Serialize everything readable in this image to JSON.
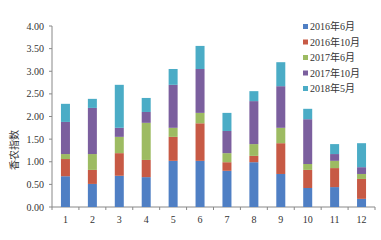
{
  "chart_data": {
    "type": "bar",
    "stacked": true,
    "title": "",
    "xlabel": "",
    "ylabel": "香农指数",
    "ylim": [
      0,
      4
    ],
    "yticks": [
      "0.00",
      "0.50",
      "1.00",
      "1.50",
      "2.00",
      "2.50",
      "3.00",
      "3.50",
      "4.00"
    ],
    "grid": false,
    "legend_position": "upper right",
    "categories": [
      "1",
      "2",
      "3",
      "4",
      "5",
      "6",
      "7",
      "8",
      "9",
      "10",
      "11",
      "12"
    ],
    "series": [
      {
        "name": "2016年6月",
        "color": "#4f7fc4",
        "values": [
          0.68,
          0.51,
          0.69,
          0.66,
          1.02,
          1.02,
          0.8,
          0.99,
          0.73,
          0.42,
          0.44,
          0.18
        ]
      },
      {
        "name": "2016年10月",
        "color": "#c75a45",
        "values": [
          0.38,
          0.31,
          0.5,
          0.38,
          0.53,
          0.83,
          0.19,
          0.14,
          0.68,
          0.4,
          0.42,
          0.44
        ]
      },
      {
        "name": "2017年6月",
        "color": "#9dbb62",
        "values": [
          0.11,
          0.35,
          0.36,
          0.82,
          0.2,
          0.23,
          0.2,
          0.26,
          0.34,
          0.13,
          0.16,
          0.11
        ]
      },
      {
        "name": "2017年10月",
        "color": "#7b5f9e",
        "values": [
          0.71,
          1.02,
          0.2,
          0.24,
          0.95,
          0.97,
          0.49,
          0.95,
          0.92,
          0.99,
          0.15,
          0.15
        ]
      },
      {
        "name": "2018年5月",
        "color": "#4bacc6",
        "values": [
          0.4,
          0.2,
          0.95,
          0.31,
          0.35,
          0.51,
          0.4,
          0.22,
          0.53,
          0.23,
          0.22,
          0.53
        ]
      }
    ]
  }
}
